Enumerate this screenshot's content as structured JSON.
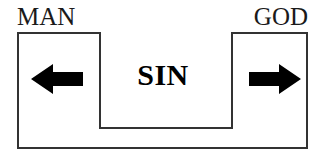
{
  "diagram": {
    "type": "concept-diagram",
    "labels": {
      "left": "MAN",
      "right": "GOD",
      "center": "SIN"
    },
    "arrows": {
      "left": {
        "name": "left-arrow",
        "direction": "left",
        "glyph": "←",
        "color": "#000000"
      },
      "right": {
        "name": "right-arrow",
        "direction": "right",
        "glyph": "→",
        "color": "#000000"
      }
    },
    "shape": {
      "name": "u-shaped-outline",
      "stroke_color": "#333333",
      "fill_color": "#ffffff",
      "stroke_width": 2
    },
    "colors": {
      "background": "#ffffff",
      "text": "#1a1a1a",
      "ink": "#000000"
    }
  }
}
